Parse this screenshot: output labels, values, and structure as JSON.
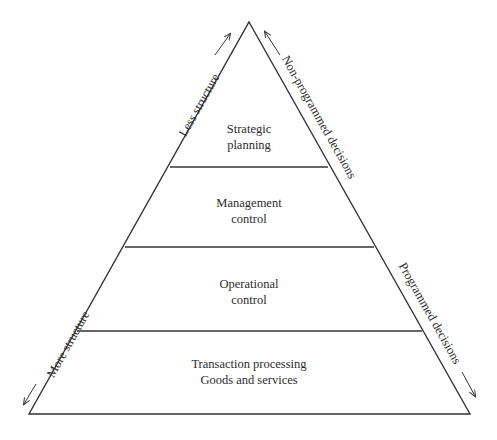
{
  "diagram": {
    "type": "pyramid",
    "colors": {
      "stroke": "#333333",
      "text": "#2b2b2b",
      "background": "#ffffff"
    },
    "levels": [
      {
        "line1": "Strategic",
        "line2": "planning"
      },
      {
        "line1": "Management",
        "line2": "control"
      },
      {
        "line1": "Operational",
        "line2": "control"
      },
      {
        "line1": "Transaction processing",
        "line2": "Goods and services"
      }
    ],
    "left_axis": {
      "top_label": "Less structure",
      "top_arrow": "arrow-up-right",
      "bottom_label": "More structure",
      "bottom_arrow": "arrow-down-left"
    },
    "right_axis": {
      "top_label": "Non-programmed decisions",
      "top_arrow": "arrow-up-left",
      "bottom_label": "Programmed decisions",
      "bottom_arrow": "arrow-down-right"
    }
  }
}
